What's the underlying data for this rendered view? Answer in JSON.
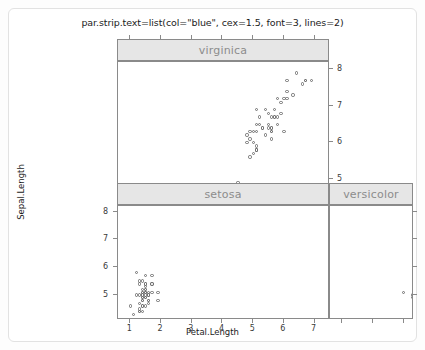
{
  "plot": {
    "title": "par.strip.text=list(col=\"blue\", cex=1.5, font=3, lines=2)",
    "xlabel": "Petal.Length",
    "ylabel": "Sepal.Length",
    "strip_text_color": "#8c8c8c",
    "strip_bg_color": "#e6e6e6",
    "panel_border_color": "#8a8a8a",
    "point_color": "#6f6f6f",
    "background_color": "#ffffff"
  },
  "chart_data": {
    "type": "scatter",
    "title": "par.strip.text=list(col=\"blue\", cex=1.5, font=3, lines=2)",
    "xlabel": "Petal.Length",
    "ylabel": "Sepal.Length",
    "xlim": [
      0.6,
      7.5
    ],
    "ylim": [
      4.1,
      8.2
    ],
    "grid": false,
    "legend": "none",
    "layout": "2x2 trellis (lattice), panels: bottom-left=setosa, bottom-right=versicolor, top-left=virginica, top-right=empty",
    "x_ticks": [
      1,
      2,
      3,
      4,
      5,
      6,
      7
    ],
    "x_tick_labels": [
      "1",
      "2",
      "3",
      "4",
      "5",
      "6",
      "7"
    ],
    "y_ticks": [
      5,
      6,
      7,
      8
    ],
    "y_tick_labels": [
      "5",
      "6",
      "7",
      "8"
    ],
    "panels": [
      {
        "name": "virginica",
        "position": "top-left",
        "x_axis_labels_visible": false,
        "y_axis_labels_visible": true,
        "y_axis_labels_side": "right",
        "points": [
          [
            6.0,
            6.3
          ],
          [
            5.1,
            5.8
          ],
          [
            5.9,
            7.1
          ],
          [
            5.6,
            6.3
          ],
          [
            5.8,
            6.5
          ],
          [
            6.6,
            7.6
          ],
          [
            4.5,
            4.9
          ],
          [
            6.3,
            7.3
          ],
          [
            5.8,
            6.7
          ],
          [
            6.1,
            7.2
          ],
          [
            5.1,
            6.5
          ],
          [
            5.3,
            6.4
          ],
          [
            5.5,
            6.8
          ],
          [
            5.0,
            5.7
          ],
          [
            5.1,
            5.8
          ],
          [
            5.3,
            6.4
          ],
          [
            5.5,
            6.5
          ],
          [
            6.7,
            7.7
          ],
          [
            6.9,
            7.7
          ],
          [
            5.0,
            6.0
          ],
          [
            5.7,
            6.9
          ],
          [
            4.9,
            5.6
          ],
          [
            6.7,
            7.7
          ],
          [
            4.9,
            6.3
          ],
          [
            5.7,
            6.7
          ],
          [
            6.0,
            7.2
          ],
          [
            4.8,
            6.2
          ],
          [
            4.9,
            6.1
          ],
          [
            5.6,
            6.4
          ],
          [
            5.8,
            7.2
          ],
          [
            6.1,
            7.4
          ],
          [
            6.4,
            7.9
          ],
          [
            5.6,
            6.4
          ],
          [
            5.1,
            6.3
          ],
          [
            5.6,
            6.1
          ],
          [
            6.1,
            7.7
          ],
          [
            5.6,
            6.3
          ],
          [
            5.5,
            6.4
          ],
          [
            4.8,
            6.0
          ],
          [
            5.4,
            6.9
          ],
          [
            5.6,
            6.7
          ],
          [
            5.1,
            6.9
          ],
          [
            5.1,
            5.8
          ],
          [
            5.9,
            6.8
          ],
          [
            5.7,
            6.7
          ],
          [
            5.2,
            6.7
          ],
          [
            5.0,
            6.3
          ],
          [
            5.2,
            6.5
          ],
          [
            5.4,
            6.2
          ],
          [
            5.1,
            5.9
          ]
        ]
      },
      {
        "name": "setosa",
        "position": "bottom-left",
        "x_axis_labels_visible": true,
        "y_axis_labels_visible": true,
        "y_axis_labels_side": "left",
        "points": [
          [
            1.4,
            5.1
          ],
          [
            1.4,
            4.9
          ],
          [
            1.3,
            4.7
          ],
          [
            1.5,
            4.6
          ],
          [
            1.4,
            5.0
          ],
          [
            1.7,
            5.4
          ],
          [
            1.4,
            4.6
          ],
          [
            1.5,
            5.0
          ],
          [
            1.4,
            4.4
          ],
          [
            1.5,
            4.9
          ],
          [
            1.5,
            5.4
          ],
          [
            1.6,
            4.8
          ],
          [
            1.4,
            4.8
          ],
          [
            1.1,
            4.3
          ],
          [
            1.2,
            5.8
          ],
          [
            1.5,
            5.7
          ],
          [
            1.3,
            5.4
          ],
          [
            1.4,
            5.1
          ],
          [
            1.7,
            5.7
          ],
          [
            1.5,
            5.1
          ],
          [
            1.7,
            5.4
          ],
          [
            1.5,
            5.1
          ],
          [
            1.0,
            4.6
          ],
          [
            1.7,
            5.1
          ],
          [
            1.9,
            4.8
          ],
          [
            1.6,
            5.0
          ],
          [
            1.6,
            5.0
          ],
          [
            1.5,
            5.2
          ],
          [
            1.4,
            5.2
          ],
          [
            1.6,
            4.7
          ],
          [
            1.6,
            4.8
          ],
          [
            1.5,
            5.4
          ],
          [
            1.5,
            5.2
          ],
          [
            1.4,
            5.5
          ],
          [
            1.5,
            4.9
          ],
          [
            1.2,
            5.0
          ],
          [
            1.3,
            5.5
          ],
          [
            1.4,
            4.9
          ],
          [
            1.3,
            4.4
          ],
          [
            1.5,
            5.1
          ],
          [
            1.3,
            5.0
          ],
          [
            1.3,
            4.5
          ],
          [
            1.3,
            4.4
          ],
          [
            1.6,
            5.0
          ],
          [
            1.9,
            5.1
          ],
          [
            1.4,
            4.8
          ],
          [
            1.6,
            5.1
          ],
          [
            1.4,
            4.6
          ],
          [
            1.5,
            5.3
          ],
          [
            1.4,
            5.0
          ]
        ]
      },
      {
        "name": "versicolor",
        "position": "bottom-right",
        "x_axis_labels_visible": false,
        "y_axis_labels_visible": false,
        "y_axis_labels_side": "none",
        "points": [
          [
            4.7,
            7.0
          ],
          [
            4.5,
            6.4
          ],
          [
            4.9,
            6.9
          ],
          [
            4.0,
            5.5
          ],
          [
            4.6,
            6.5
          ],
          [
            4.5,
            5.7
          ],
          [
            4.7,
            6.3
          ],
          [
            3.3,
            4.9
          ],
          [
            4.6,
            6.6
          ],
          [
            3.9,
            5.2
          ],
          [
            3.5,
            5.0
          ],
          [
            4.2,
            5.9
          ],
          [
            4.0,
            6.0
          ],
          [
            4.7,
            6.1
          ],
          [
            3.6,
            5.6
          ],
          [
            4.4,
            6.7
          ],
          [
            4.5,
            5.6
          ],
          [
            4.1,
            5.8
          ],
          [
            4.5,
            6.2
          ],
          [
            3.9,
            5.6
          ],
          [
            4.8,
            5.9
          ],
          [
            4.0,
            6.1
          ],
          [
            4.9,
            6.3
          ],
          [
            4.7,
            6.1
          ],
          [
            4.3,
            6.4
          ],
          [
            4.4,
            6.6
          ],
          [
            4.8,
            6.8
          ],
          [
            5.0,
            6.7
          ],
          [
            4.5,
            6.0
          ],
          [
            3.5,
            5.7
          ],
          [
            3.8,
            5.5
          ],
          [
            3.7,
            5.5
          ],
          [
            3.9,
            5.8
          ],
          [
            5.1,
            6.0
          ],
          [
            4.5,
            5.4
          ],
          [
            4.5,
            6.0
          ],
          [
            4.7,
            6.7
          ],
          [
            4.4,
            6.3
          ],
          [
            4.1,
            5.6
          ],
          [
            4.0,
            5.5
          ],
          [
            4.4,
            5.5
          ],
          [
            4.6,
            6.1
          ],
          [
            4.0,
            5.8
          ],
          [
            3.3,
            5.0
          ],
          [
            4.2,
            5.6
          ],
          [
            4.2,
            5.7
          ],
          [
            4.2,
            5.7
          ],
          [
            4.3,
            6.2
          ],
          [
            3.0,
            5.1
          ],
          [
            4.1,
            5.7
          ]
        ]
      }
    ]
  }
}
